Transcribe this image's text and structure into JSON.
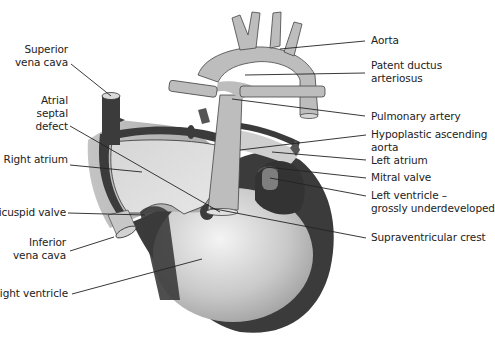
{
  "figure": {
    "title_fragment": "",
    "colors": {
      "background": "#ffffff",
      "muscle": "#3a3a3a",
      "chamber_light": "#d8d8d8",
      "vessel": "#b8b8b8",
      "ventricle_center": "#f2f2f2",
      "ventricle_edge": "#9a9a9a",
      "leader_line": "#222222",
      "text": "#222222"
    }
  },
  "labels_left": [
    {
      "id": "superior-vena-cava",
      "lines": [
        "Superior",
        "vena cava"
      ]
    },
    {
      "id": "atrial-septal-defect",
      "lines": [
        "Atrial",
        "septal",
        "defect"
      ]
    },
    {
      "id": "right-atrium",
      "lines": [
        "Right atrium"
      ]
    },
    {
      "id": "tricuspid-valve",
      "lines": [
        "Tricuspid valve"
      ]
    },
    {
      "id": "inferior-vena-cava",
      "lines": [
        "Inferior",
        "vena cava"
      ]
    },
    {
      "id": "right-ventricle",
      "lines": [
        "Right ventricle"
      ]
    }
  ],
  "labels_right": [
    {
      "id": "aorta",
      "lines": [
        "Aorta"
      ]
    },
    {
      "id": "patent-ductus-arteriosus",
      "lines": [
        "Patent ductus",
        "arteriosus"
      ]
    },
    {
      "id": "pulmonary-artery",
      "lines": [
        "Pulmonary artery"
      ]
    },
    {
      "id": "hypoplastic-ascending-aorta",
      "lines": [
        "Hypoplastic ascending",
        "aorta"
      ]
    },
    {
      "id": "left-atrium",
      "lines": [
        "Left atrium"
      ]
    },
    {
      "id": "mitral-valve",
      "lines": [
        "Mitral valve"
      ]
    },
    {
      "id": "left-ventricle",
      "lines": [
        "Left ventricle –",
        "grossly underdeveloped"
      ]
    },
    {
      "id": "supraventricular-crest",
      "lines": [
        "Supraventricular crest"
      ]
    }
  ]
}
